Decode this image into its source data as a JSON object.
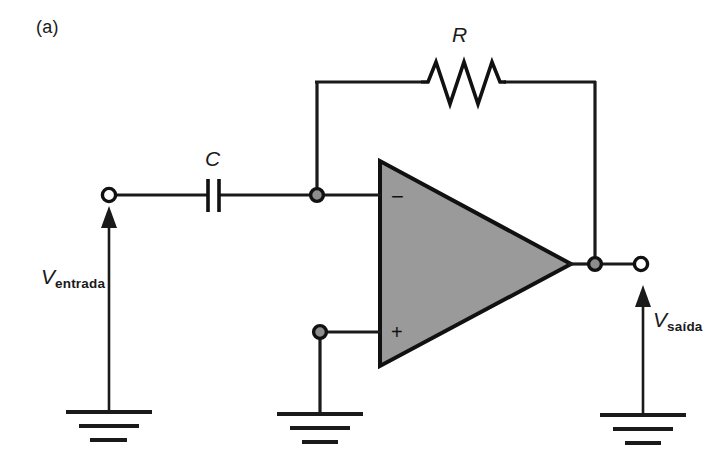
{
  "figure": {
    "panel_label": "(a)",
    "background_color": "#ffffff",
    "line_color": "#1a1a1a",
    "opamp_fill_color": "#9a9a9a"
  },
  "components": {
    "resistor": {
      "label": "R",
      "name": "feedback-resistor"
    },
    "capacitor": {
      "label": "C",
      "name": "input-capacitor"
    },
    "opamp": {
      "inverting_input_sign": "−",
      "noninverting_input_sign": "+",
      "name": "operational-amplifier"
    }
  },
  "terminals": {
    "input": {
      "symbol": "V",
      "subscript": "entrada",
      "full_label": "Ventrada"
    },
    "output": {
      "symbol": "V",
      "subscript": "saída",
      "full_label": "Vsaída"
    }
  },
  "grounds": [
    {
      "name": "ground-input"
    },
    {
      "name": "ground-noninverting"
    },
    {
      "name": "ground-output"
    }
  ]
}
